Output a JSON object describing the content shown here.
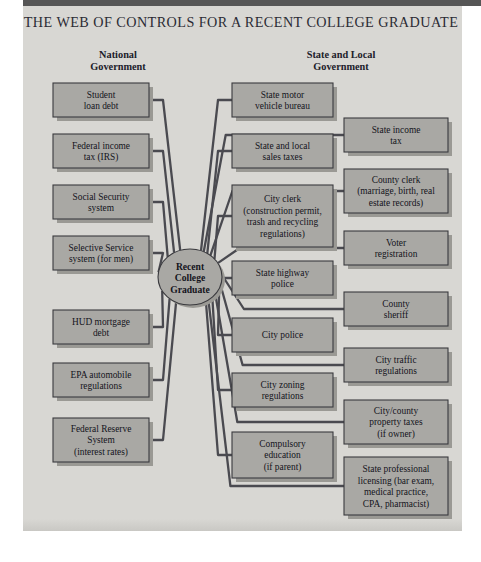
{
  "figure": {
    "title": "THE WEB OF CONTROLS FOR A RECENT COLLEGE GRADUATE",
    "center_node": {
      "line1": "Recent",
      "line2": "College",
      "line3": "Graduate"
    },
    "headers": {
      "left": {
        "line1": "National",
        "line2": "Government"
      },
      "right": {
        "line1": "State and Local",
        "line2": "Government"
      }
    },
    "colors": {
      "panel_background": "#d8d7d3",
      "box_fill": "#a9a8a4",
      "box_border": "#3a3a3e",
      "connector": "#4a4a50",
      "shadow": "#9a9994",
      "title_text": "#2b2b33",
      "top_bar": "#565656"
    },
    "columns": {
      "left": {
        "group": "National Government",
        "nodes": [
          {
            "id": "student-loan-debt",
            "lines": [
              "Student",
              "loan debt"
            ]
          },
          {
            "id": "federal-income-tax",
            "lines": [
              "Federal income",
              "tax (IRS)"
            ]
          },
          {
            "id": "social-security",
            "lines": [
              "Social Security",
              "system"
            ]
          },
          {
            "id": "selective-service",
            "lines": [
              "Selective Service",
              "system (for men)"
            ]
          },
          {
            "id": "hud-mortgage-debt",
            "lines": [
              "HUD mortgage",
              "debt"
            ]
          },
          {
            "id": "epa-automobile",
            "lines": [
              "EPA automobile",
              "regulations"
            ]
          },
          {
            "id": "federal-reserve",
            "lines": [
              "Federal Reserve",
              "System",
              "(interest rates)"
            ]
          }
        ]
      },
      "middle": {
        "group": "State and Local Government",
        "nodes": [
          {
            "id": "state-motor-vehicle-bureau",
            "lines": [
              "State motor",
              "vehicle bureau"
            ]
          },
          {
            "id": "state-local-sales-taxes",
            "lines": [
              "State and local",
              "sales taxes"
            ]
          },
          {
            "id": "city-clerk",
            "lines": [
              "City clerk",
              "(construction permit,",
              "trash and recycling",
              "regulations)"
            ]
          },
          {
            "id": "state-highway-police",
            "lines": [
              "State highway",
              "police"
            ]
          },
          {
            "id": "city-police",
            "lines": [
              "City police"
            ]
          },
          {
            "id": "city-zoning-regulations",
            "lines": [
              "City zoning",
              "regulations"
            ]
          },
          {
            "id": "compulsory-education",
            "lines": [
              "Compulsory",
              "education",
              "(if parent)"
            ]
          }
        ]
      },
      "right": {
        "group": "State and Local Government",
        "nodes": [
          {
            "id": "state-income-tax",
            "lines": [
              "State income",
              "tax"
            ]
          },
          {
            "id": "county-clerk",
            "lines": [
              "County clerk",
              "(marriage, birth, real",
              "estate records)"
            ]
          },
          {
            "id": "voter-registration",
            "lines": [
              "Voter",
              "registration"
            ]
          },
          {
            "id": "county-sheriff",
            "lines": [
              "County",
              "sheriff"
            ]
          },
          {
            "id": "city-traffic-regulations",
            "lines": [
              "City traffic",
              "regulations"
            ]
          },
          {
            "id": "city-county-property-taxes",
            "lines": [
              "City/county",
              "property taxes",
              "(if owner)"
            ]
          },
          {
            "id": "state-professional-licensing",
            "lines": [
              "State professional",
              "licensing (bar exam,",
              "medical practice,",
              "CPA, pharmacist)"
            ]
          }
        ]
      }
    }
  }
}
